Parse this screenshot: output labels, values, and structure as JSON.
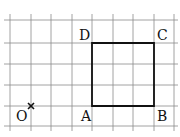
{
  "diagram": {
    "type": "grid-geometry",
    "grid": {
      "x_lines": [
        10,
        31,
        51,
        72,
        92,
        113,
        133,
        154,
        174
      ],
      "y_lines": [
        20,
        43,
        64,
        85,
        106,
        126
      ],
      "color": "#8a8a8a"
    },
    "square": {
      "vertices": {
        "A": [
          92,
          106
        ],
        "B": [
          154,
          106
        ],
        "C": [
          154,
          43
        ],
        "D": [
          92,
          43
        ]
      },
      "color": "#111111"
    },
    "point_O": {
      "x": 31,
      "y": 106,
      "marker": "×"
    },
    "labels": {
      "O": "O",
      "A": "A",
      "B": "B",
      "C": "C",
      "D": "D"
    }
  }
}
